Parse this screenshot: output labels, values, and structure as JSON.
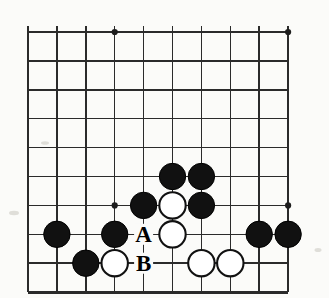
{
  "figure": {
    "board": {
      "columns": 10,
      "rows": 10,
      "grid_color": "#2b2b2b",
      "background_color": "#fbfbf9",
      "black_color": "#111111",
      "white_color": "#ffffff",
      "left_px": 28,
      "top_px": 32,
      "spacing_px": 28.9,
      "stone_radius_px": 13.2,
      "edges": {
        "left": "thick",
        "bottom": "thick",
        "top": "thin",
        "right": "thin"
      }
    },
    "star_points": [
      {
        "name": "star-point-top-left",
        "col": 4,
        "row": 1
      },
      {
        "name": "star-point-top-right",
        "col": 10,
        "row": 1
      },
      {
        "name": "star-point-bottom-left",
        "col": 4,
        "row": 7
      },
      {
        "name": "star-point-bottom-right",
        "col": 10,
        "row": 7
      }
    ],
    "stones": [
      {
        "id": "black-f6",
        "color": "black",
        "col": 6,
        "row": 6
      },
      {
        "id": "black-g6",
        "color": "black",
        "col": 7,
        "row": 6
      },
      {
        "id": "black-e7",
        "color": "black",
        "col": 5,
        "row": 7
      },
      {
        "id": "white-f7",
        "color": "white",
        "col": 6,
        "row": 7
      },
      {
        "id": "black-g7",
        "color": "black",
        "col": 7,
        "row": 7
      },
      {
        "id": "black-b8",
        "color": "black",
        "col": 2,
        "row": 8
      },
      {
        "id": "black-d8",
        "color": "black",
        "col": 4,
        "row": 8
      },
      {
        "id": "white-f8",
        "color": "white",
        "col": 6,
        "row": 8
      },
      {
        "id": "black-i8",
        "color": "black",
        "col": 9,
        "row": 8
      },
      {
        "id": "black-j8",
        "color": "black",
        "col": 10,
        "row": 8
      },
      {
        "id": "black-c9",
        "color": "black",
        "col": 3,
        "row": 9
      },
      {
        "id": "white-d9",
        "color": "white",
        "col": 4,
        "row": 9
      },
      {
        "id": "white-g9",
        "color": "white",
        "col": 7,
        "row": 9
      },
      {
        "id": "white-h9",
        "color": "white",
        "col": 8,
        "row": 9
      }
    ],
    "markers": [
      {
        "id": "marker-a",
        "label": "A",
        "col": 5,
        "row": 8
      },
      {
        "id": "marker-b",
        "label": "B",
        "col": 5,
        "row": 9
      }
    ]
  }
}
